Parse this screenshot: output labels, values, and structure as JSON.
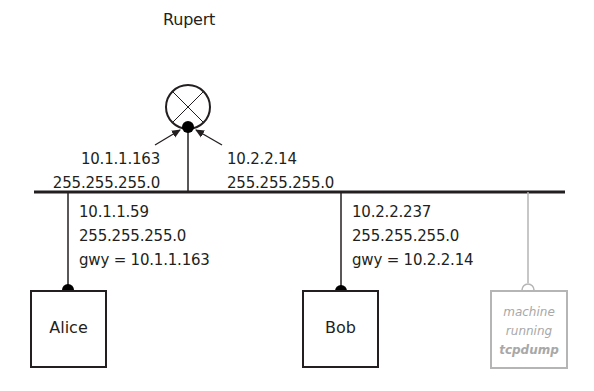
{
  "diagram": {
    "router": {
      "name": "Rupert",
      "interface_left": {
        "ip": "10.1.1.163",
        "mask": "255.255.255.0"
      },
      "interface_right": {
        "ip": "10.2.2.14",
        "mask": "255.255.255.0"
      }
    },
    "hosts": [
      {
        "name": "Alice",
        "ip": "10.1.1.59",
        "mask": "255.255.255.0",
        "gateway": "gwy = 10.1.1.163"
      },
      {
        "name": "Bob",
        "ip": "10.2.2.237",
        "mask": "255.255.255.0",
        "gateway": "gwy = 10.2.2.14"
      }
    ],
    "sniffer": {
      "line1": "machine",
      "line2": "running",
      "line3": "tcpdump"
    },
    "colors": {
      "line": "#231f20",
      "ghost": "#b5b5b5",
      "ghost_text": "#a8a8a8"
    }
  }
}
